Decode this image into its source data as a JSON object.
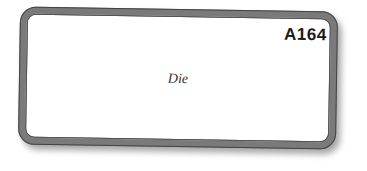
{
  "card": {
    "code": "A164",
    "word": "Die",
    "border_color": "#7a7a7a"
  }
}
